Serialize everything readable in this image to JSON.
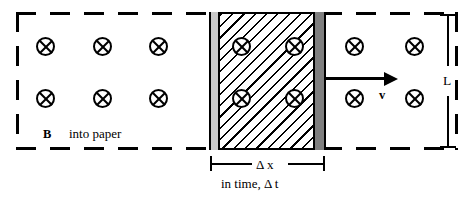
{
  "figure": {
    "width": 474,
    "height": 198
  },
  "labels": {
    "field_symbol_bold": "B",
    "field_direction": "into paper",
    "velocity": "v",
    "height_dimension": "L",
    "width_dimension": "Δ x",
    "time_note": "in time, Δ t"
  },
  "icons": {
    "field_into_page": "circle-x-icon",
    "velocity_arrow": "arrow-right-icon"
  },
  "colors": {
    "ink": "#000000",
    "background": "#ffffff",
    "left_bar_fill": "#c9c9c9",
    "right_bar_fill": "#7f7f7f",
    "hatch": "#000000"
  },
  "geometry": {
    "field_region": {
      "x": 16,
      "y": 12,
      "width": 442,
      "height": 138
    },
    "swept_area": {
      "x": 209,
      "y": 12,
      "width": 117,
      "height": 138
    },
    "left_bar": {
      "x": 209,
      "y": 12,
      "width": 11,
      "height": 138
    },
    "right_bar": {
      "x": 313,
      "y": 12,
      "width": 13,
      "height": 138
    }
  },
  "field_symbols": {
    "outside_left_row1": [
      {
        "x": 36,
        "y": 37
      },
      {
        "x": 93,
        "y": 37
      },
      {
        "x": 149,
        "y": 37
      }
    ],
    "outside_left_row2": [
      {
        "x": 36,
        "y": 89
      },
      {
        "x": 93,
        "y": 89
      },
      {
        "x": 149,
        "y": 89
      }
    ],
    "inside_row1": [
      {
        "x": 232,
        "y": 37
      },
      {
        "x": 285,
        "y": 37
      }
    ],
    "inside_row2": [
      {
        "x": 232,
        "y": 89
      },
      {
        "x": 285,
        "y": 89
      }
    ],
    "outside_right_row1": [
      {
        "x": 345,
        "y": 37
      },
      {
        "x": 405,
        "y": 37
      }
    ],
    "outside_right_row2": [
      {
        "x": 345,
        "y": 89
      },
      {
        "x": 405,
        "y": 89
      }
    ]
  }
}
